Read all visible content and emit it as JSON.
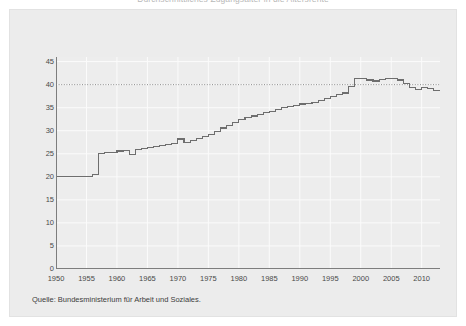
{
  "title": {
    "text": "Durchschnittliches Zugangsalter in die Altersrente",
    "clipped": true
  },
  "source": {
    "label": "Quelle: Bundesministerium für Arbeit und Soziales."
  },
  "colors": {
    "page_background": "#ffffff",
    "panel_background": "#ececec",
    "plot_background": "#ededed",
    "gridline": "#fbfbfb",
    "axis": "#7d7d7d",
    "line": "#6e6e6e",
    "reference_line": "#8a8a8a",
    "tick_label": "#4a4a4a"
  },
  "chart_data": {
    "type": "line",
    "title": "Durchschnittliches Zugangsalter in die Altersrente",
    "xlabel": "",
    "ylabel": "",
    "xlim": [
      1950,
      2013
    ],
    "ylim": [
      0,
      46
    ],
    "grid": true,
    "legend": "none",
    "step": "post",
    "y_ticks": [
      0,
      5,
      10,
      15,
      20,
      25,
      30,
      35,
      40,
      45
    ],
    "y_tick_labels": [
      "0",
      "5",
      "10",
      "15",
      "20",
      "25",
      "30",
      "35",
      "40",
      "45"
    ],
    "x_ticks": [
      1950,
      1955,
      1960,
      1965,
      1970,
      1975,
      1980,
      1985,
      1990,
      1995,
      2000,
      2005,
      2010
    ],
    "x_tick_labels": [
      "1950",
      "1955",
      "1960",
      "1965",
      "1970",
      "1975",
      "1980",
      "1985",
      "1990",
      "1995",
      "2000",
      "2005",
      "2010"
    ],
    "reference_lines": [
      {
        "axis": "y",
        "value": 40,
        "style": "dotted",
        "label": ""
      }
    ],
    "series": [
      {
        "name": "Zugangsalter",
        "x": [
          1950,
          1951,
          1952,
          1953,
          1954,
          1955,
          1956,
          1957,
          1958,
          1959,
          1960,
          1961,
          1962,
          1963,
          1964,
          1965,
          1966,
          1967,
          1968,
          1969,
          1970,
          1971,
          1972,
          1973,
          1974,
          1975,
          1976,
          1977,
          1978,
          1979,
          1980,
          1981,
          1982,
          1983,
          1984,
          1985,
          1986,
          1987,
          1988,
          1989,
          1990,
          1991,
          1992,
          1993,
          1994,
          1995,
          1996,
          1997,
          1998,
          1999,
          2000,
          2001,
          2002,
          2003,
          2004,
          2005,
          2006,
          2007,
          2008,
          2009,
          2010,
          2011,
          2012,
          2013
        ],
        "values": [
          20.0,
          20.0,
          20.0,
          20.0,
          20.0,
          20.0,
          20.6,
          25.0,
          25.2,
          25.3,
          25.6,
          25.8,
          24.9,
          25.9,
          26.2,
          26.4,
          26.6,
          26.8,
          27.0,
          27.2,
          28.2,
          27.4,
          27.8,
          28.4,
          28.8,
          29.2,
          29.8,
          30.6,
          31.2,
          31.8,
          32.4,
          32.8,
          33.2,
          33.6,
          33.9,
          34.2,
          34.6,
          35.0,
          35.2,
          35.5,
          35.8,
          36.0,
          36.2,
          36.6,
          37.0,
          37.4,
          37.8,
          38.2,
          39.6,
          41.4,
          41.3,
          41.0,
          40.8,
          41.2,
          41.4,
          41.4,
          41.0,
          40.2,
          39.3,
          39.0,
          39.3,
          39.2,
          38.8,
          38.6
        ]
      }
    ]
  }
}
